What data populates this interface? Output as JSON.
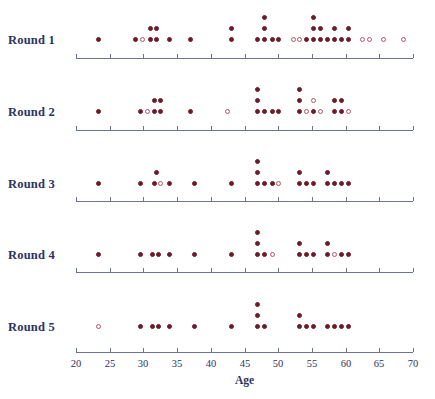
{
  "chart_data": {
    "type": "scatter",
    "subtype": "stacked-dot-plot",
    "title": "",
    "xlabel": "Age",
    "ylabel": "",
    "xlim": [
      20,
      70
    ],
    "xticks": [
      20,
      25,
      30,
      35,
      40,
      45,
      50,
      55,
      60,
      65,
      70
    ],
    "xtick_labels": [
      "20",
      "25",
      "30",
      "35",
      "40",
      "45",
      "50",
      "55",
      "60",
      "65",
      "70"
    ],
    "grid": false,
    "legend": false,
    "marker_styles": {
      "filled": "#6e1b28",
      "open": "#b5556a"
    },
    "categories": [
      "Round 1",
      "Round 2",
      "Round 3",
      "Round 4",
      "Round 5"
    ],
    "series": [
      {
        "name": "Round 1",
        "points": [
          {
            "age": 23.3,
            "stack": 1,
            "style": "filled"
          },
          {
            "age": 28.9,
            "stack": 1,
            "style": "filled"
          },
          {
            "age": 29.9,
            "stack": 1,
            "style": "open"
          },
          {
            "age": 31.0,
            "stack": 1,
            "style": "filled"
          },
          {
            "age": 31.0,
            "stack": 2,
            "style": "filled"
          },
          {
            "age": 32.0,
            "stack": 1,
            "style": "filled"
          },
          {
            "age": 32.0,
            "stack": 2,
            "style": "filled"
          },
          {
            "age": 33.9,
            "stack": 1,
            "style": "filled"
          },
          {
            "age": 37.0,
            "stack": 1,
            "style": "filled"
          },
          {
            "age": 43.0,
            "stack": 1,
            "style": "filled"
          },
          {
            "age": 43.0,
            "stack": 2,
            "style": "filled"
          },
          {
            "age": 47.0,
            "stack": 1,
            "style": "filled"
          },
          {
            "age": 48.0,
            "stack": 1,
            "style": "filled"
          },
          {
            "age": 48.0,
            "stack": 2,
            "style": "filled"
          },
          {
            "age": 48.0,
            "stack": 3,
            "style": "filled"
          },
          {
            "age": 49.1,
            "stack": 1,
            "style": "filled"
          },
          {
            "age": 50.1,
            "stack": 1,
            "style": "filled"
          },
          {
            "age": 52.2,
            "stack": 1,
            "style": "open"
          },
          {
            "age": 53.2,
            "stack": 1,
            "style": "open"
          },
          {
            "age": 54.2,
            "stack": 1,
            "style": "filled"
          },
          {
            "age": 55.3,
            "stack": 1,
            "style": "filled"
          },
          {
            "age": 55.3,
            "stack": 2,
            "style": "filled"
          },
          {
            "age": 55.3,
            "stack": 3,
            "style": "filled"
          },
          {
            "age": 56.3,
            "stack": 1,
            "style": "filled"
          },
          {
            "age": 56.3,
            "stack": 2,
            "style": "filled"
          },
          {
            "age": 57.3,
            "stack": 1,
            "style": "filled"
          },
          {
            "age": 58.4,
            "stack": 1,
            "style": "filled"
          },
          {
            "age": 58.4,
            "stack": 2,
            "style": "filled"
          },
          {
            "age": 59.4,
            "stack": 1,
            "style": "filled"
          },
          {
            "age": 60.4,
            "stack": 1,
            "style": "filled"
          },
          {
            "age": 60.4,
            "stack": 2,
            "style": "filled"
          },
          {
            "age": 62.5,
            "stack": 1,
            "style": "open"
          },
          {
            "age": 63.5,
            "stack": 1,
            "style": "open"
          },
          {
            "age": 65.6,
            "stack": 1,
            "style": "open"
          },
          {
            "age": 68.6,
            "stack": 1,
            "style": "open"
          }
        ]
      },
      {
        "name": "Round 2",
        "points": [
          {
            "age": 23.3,
            "stack": 1,
            "style": "filled"
          },
          {
            "age": 29.5,
            "stack": 1,
            "style": "filled"
          },
          {
            "age": 30.6,
            "stack": 1,
            "style": "open"
          },
          {
            "age": 31.6,
            "stack": 1,
            "style": "filled"
          },
          {
            "age": 31.6,
            "stack": 2,
            "style": "filled"
          },
          {
            "age": 32.6,
            "stack": 1,
            "style": "filled"
          },
          {
            "age": 32.6,
            "stack": 2,
            "style": "filled"
          },
          {
            "age": 37.0,
            "stack": 1,
            "style": "filled"
          },
          {
            "age": 42.5,
            "stack": 1,
            "style": "open"
          },
          {
            "age": 47.0,
            "stack": 1,
            "style": "filled"
          },
          {
            "age": 47.0,
            "stack": 2,
            "style": "filled"
          },
          {
            "age": 47.0,
            "stack": 3,
            "style": "filled"
          },
          {
            "age": 48.0,
            "stack": 1,
            "style": "filled"
          },
          {
            "age": 49.1,
            "stack": 1,
            "style": "filled"
          },
          {
            "age": 50.1,
            "stack": 1,
            "style": "filled"
          },
          {
            "age": 53.2,
            "stack": 1,
            "style": "filled"
          },
          {
            "age": 53.2,
            "stack": 2,
            "style": "filled"
          },
          {
            "age": 53.2,
            "stack": 3,
            "style": "filled"
          },
          {
            "age": 54.2,
            "stack": 1,
            "style": "open"
          },
          {
            "age": 55.3,
            "stack": 1,
            "style": "filled"
          },
          {
            "age": 55.3,
            "stack": 2,
            "style": "open"
          },
          {
            "age": 56.3,
            "stack": 1,
            "style": "open"
          },
          {
            "age": 58.4,
            "stack": 1,
            "style": "filled"
          },
          {
            "age": 58.4,
            "stack": 2,
            "style": "filled"
          },
          {
            "age": 59.4,
            "stack": 1,
            "style": "filled"
          },
          {
            "age": 59.4,
            "stack": 2,
            "style": "filled"
          },
          {
            "age": 60.4,
            "stack": 1,
            "style": "open"
          }
        ]
      },
      {
        "name": "Round 3",
        "points": [
          {
            "age": 23.3,
            "stack": 1,
            "style": "filled"
          },
          {
            "age": 29.5,
            "stack": 1,
            "style": "filled"
          },
          {
            "age": 31.6,
            "stack": 1,
            "style": "filled"
          },
          {
            "age": 32.0,
            "stack": 2,
            "style": "filled"
          },
          {
            "age": 32.6,
            "stack": 1,
            "style": "open"
          },
          {
            "age": 33.9,
            "stack": 1,
            "style": "filled"
          },
          {
            "age": 37.6,
            "stack": 1,
            "style": "filled"
          },
          {
            "age": 43.0,
            "stack": 1,
            "style": "filled"
          },
          {
            "age": 47.0,
            "stack": 1,
            "style": "filled"
          },
          {
            "age": 47.0,
            "stack": 2,
            "style": "filled"
          },
          {
            "age": 47.0,
            "stack": 3,
            "style": "filled"
          },
          {
            "age": 48.0,
            "stack": 1,
            "style": "filled"
          },
          {
            "age": 49.1,
            "stack": 1,
            "style": "filled"
          },
          {
            "age": 50.1,
            "stack": 1,
            "style": "open"
          },
          {
            "age": 53.2,
            "stack": 1,
            "style": "filled"
          },
          {
            "age": 53.2,
            "stack": 2,
            "style": "filled"
          },
          {
            "age": 54.2,
            "stack": 1,
            "style": "filled"
          },
          {
            "age": 55.3,
            "stack": 1,
            "style": "filled"
          },
          {
            "age": 57.3,
            "stack": 1,
            "style": "filled"
          },
          {
            "age": 57.3,
            "stack": 2,
            "style": "filled"
          },
          {
            "age": 58.4,
            "stack": 1,
            "style": "filled"
          },
          {
            "age": 59.4,
            "stack": 1,
            "style": "filled"
          },
          {
            "age": 60.4,
            "stack": 1,
            "style": "filled"
          }
        ]
      },
      {
        "name": "Round 4",
        "points": [
          {
            "age": 23.3,
            "stack": 1,
            "style": "filled"
          },
          {
            "age": 29.5,
            "stack": 1,
            "style": "filled"
          },
          {
            "age": 31.3,
            "stack": 1,
            "style": "filled"
          },
          {
            "age": 32.2,
            "stack": 1,
            "style": "filled"
          },
          {
            "age": 33.9,
            "stack": 1,
            "style": "filled"
          },
          {
            "age": 37.6,
            "stack": 1,
            "style": "filled"
          },
          {
            "age": 43.0,
            "stack": 1,
            "style": "filled"
          },
          {
            "age": 47.0,
            "stack": 1,
            "style": "filled"
          },
          {
            "age": 47.0,
            "stack": 2,
            "style": "filled"
          },
          {
            "age": 47.0,
            "stack": 3,
            "style": "filled"
          },
          {
            "age": 48.0,
            "stack": 1,
            "style": "filled"
          },
          {
            "age": 49.1,
            "stack": 1,
            "style": "open"
          },
          {
            "age": 53.2,
            "stack": 1,
            "style": "filled"
          },
          {
            "age": 53.2,
            "stack": 2,
            "style": "filled"
          },
          {
            "age": 54.2,
            "stack": 1,
            "style": "filled"
          },
          {
            "age": 55.3,
            "stack": 1,
            "style": "filled"
          },
          {
            "age": 57.3,
            "stack": 1,
            "style": "filled"
          },
          {
            "age": 57.3,
            "stack": 2,
            "style": "filled"
          },
          {
            "age": 58.4,
            "stack": 1,
            "style": "open"
          },
          {
            "age": 59.4,
            "stack": 1,
            "style": "filled"
          },
          {
            "age": 60.4,
            "stack": 1,
            "style": "filled"
          }
        ]
      },
      {
        "name": "Round 5",
        "points": [
          {
            "age": 23.3,
            "stack": 1,
            "style": "open"
          },
          {
            "age": 29.5,
            "stack": 1,
            "style": "filled"
          },
          {
            "age": 31.3,
            "stack": 1,
            "style": "filled"
          },
          {
            "age": 32.2,
            "stack": 1,
            "style": "filled"
          },
          {
            "age": 33.9,
            "stack": 1,
            "style": "filled"
          },
          {
            "age": 37.6,
            "stack": 1,
            "style": "filled"
          },
          {
            "age": 43.0,
            "stack": 1,
            "style": "filled"
          },
          {
            "age": 47.0,
            "stack": 1,
            "style": "filled"
          },
          {
            "age": 47.0,
            "stack": 2,
            "style": "filled"
          },
          {
            "age": 47.0,
            "stack": 3,
            "style": "filled"
          },
          {
            "age": 48.0,
            "stack": 1,
            "style": "filled"
          },
          {
            "age": 53.2,
            "stack": 1,
            "style": "filled"
          },
          {
            "age": 53.2,
            "stack": 2,
            "style": "filled"
          },
          {
            "age": 54.2,
            "stack": 1,
            "style": "filled"
          },
          {
            "age": 55.3,
            "stack": 1,
            "style": "filled"
          },
          {
            "age": 57.3,
            "stack": 1,
            "style": "filled"
          },
          {
            "age": 58.4,
            "stack": 1,
            "style": "filled"
          },
          {
            "age": 59.4,
            "stack": 1,
            "style": "filled"
          },
          {
            "age": 60.4,
            "stack": 1,
            "style": "filled"
          }
        ]
      }
    ]
  },
  "layout": {
    "axis_x_start_px": 76,
    "axis_x_end_px": 413,
    "row_baselines_px": [
      42,
      114,
      186,
      257,
      329
    ],
    "axis_line_y_px": [
      58,
      130,
      201,
      272,
      352
    ],
    "label_x_px": 8,
    "label_y_px": [
      33,
      105,
      177,
      248,
      320
    ],
    "stack_spacing_px": 11,
    "dot_size_px": 5
  }
}
